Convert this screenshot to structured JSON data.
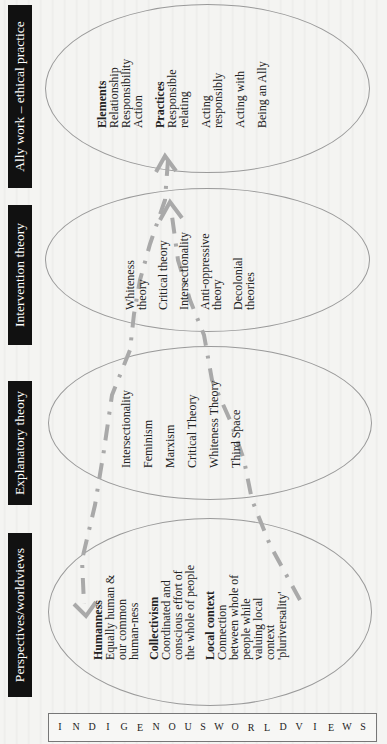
{
  "side_label": {
    "text": "INDIGENOUS WORLDVIEWS",
    "letters": [
      "I",
      "N",
      "D",
      "I",
      "G",
      "E",
      "N",
      "O",
      "U",
      "S",
      "W",
      "O",
      "R",
      "L",
      "D",
      "V",
      "I",
      "E",
      "W",
      "S"
    ]
  },
  "stages": [
    {
      "header": "Perspectives/worldviews",
      "lines": [
        {
          "text": "Humanness",
          "bold": true
        },
        {
          "text": "Equally human &"
        },
        {
          "text": "our common"
        },
        {
          "text": "human-ness"
        },
        {
          "text": ""
        },
        {
          "text": "Collectivism",
          "bold": true
        },
        {
          "text": "Coordinated and"
        },
        {
          "text": "conscious effort of"
        },
        {
          "text": "the whole of people"
        },
        {
          "text": ""
        },
        {
          "text": "Local context",
          "bold": true
        },
        {
          "text": "Connection"
        },
        {
          "text": "between whole of"
        },
        {
          "text": "people while"
        },
        {
          "text": "valuing local"
        },
        {
          "text": "context"
        },
        {
          "text": "'pluriversality'"
        }
      ]
    },
    {
      "header": "Explanatory theory",
      "lines": [
        {
          "text": "Intersectionality"
        },
        {
          "text": ""
        },
        {
          "text": "Feminism"
        },
        {
          "text": ""
        },
        {
          "text": "Marxism"
        },
        {
          "text": ""
        },
        {
          "text": "Critical Theory"
        },
        {
          "text": ""
        },
        {
          "text": "Whiteness Theory"
        },
        {
          "text": ""
        },
        {
          "text": "Third Space"
        }
      ]
    },
    {
      "header": "Intervention theory",
      "lines": [
        {
          "text": "Whiteness"
        },
        {
          "text": "theory"
        },
        {
          "text": ""
        },
        {
          "text": "Critical theory"
        },
        {
          "text": ""
        },
        {
          "text": "Intersectionality"
        },
        {
          "text": ""
        },
        {
          "text": "Anti-oppressive"
        },
        {
          "text": "theory"
        },
        {
          "text": ""
        },
        {
          "text": "Decolonial"
        },
        {
          "text": "theories"
        }
      ]
    },
    {
      "header": "Ally work – ethical practice",
      "lines": [
        {
          "text": "Elements",
          "bold": true
        },
        {
          "text": "Relationship"
        },
        {
          "text": "Responsibility"
        },
        {
          "text": "Action"
        },
        {
          "text": ""
        },
        {
          "text": "Practices",
          "bold": true
        },
        {
          "text": "Responsible"
        },
        {
          "text": "relating"
        },
        {
          "text": ""
        },
        {
          "text": "Acting"
        },
        {
          "text": "responsibly"
        },
        {
          "text": ""
        },
        {
          "text": "Acting with"
        },
        {
          "text": ""
        },
        {
          "text": "Being an Ally"
        }
      ]
    }
  ],
  "connectors": {
    "color": "#a9a9a9",
    "style": "dashed",
    "forward_path": "Ally work to Perspectives/worldviews (arrow at worldviews)",
    "return_path": "Perspectives/worldviews to Ally work (arrow at ally work)"
  },
  "colors": {
    "header_bg": "#111111",
    "header_text": "#ffffff",
    "ellipse_stroke": "#9a9a9a",
    "page_bg": "#f4f4f2"
  }
}
